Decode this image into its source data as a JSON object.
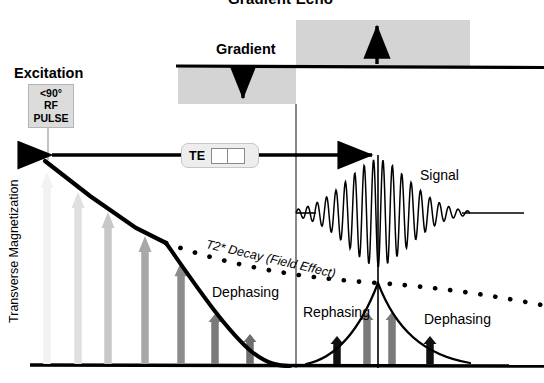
{
  "title": "Gradient Echo",
  "labels": {
    "excitation": "Excitation",
    "gradient": "Gradient",
    "signal": "Signal",
    "te": "TE",
    "t2_decay": "T2* Decay (Field Effect)",
    "y_axis": "Transverse Magnetization",
    "dephasing_1": "Dephasing",
    "rephasing": "Rephasing",
    "dephasing_2": "Dephasing"
  },
  "rf_pulse": {
    "flip_angle": "<90°",
    "line2": "RF",
    "line3": "PULSE"
  },
  "colors": {
    "ink": "#000000",
    "pulse_box_fill": "#dcdcdc",
    "gradient_lobe_fill": "#d4d4d4",
    "te_pill_fill": "#ededed",
    "grid_line": "#555555"
  },
  "chart_data": {
    "type": "line",
    "title": "Gradient Echo",
    "xlabel": "",
    "ylabel": "Transverse Magnetization",
    "grid": false,
    "legend": "none",
    "annotations": [
      "Excitation",
      "Gradient",
      "TE",
      "Signal",
      "T2* Decay (Field Effect)",
      "Dephasing",
      "Rephasing",
      "Dephasing"
    ],
    "series": [
      {
        "name": "T2 envelope (true decay)",
        "style": "solid-thick",
        "x": [
          45,
          90,
          135,
          180,
          225,
          252
        ],
        "y": [
          162,
          196,
          226,
          256,
          288,
          301
        ]
      },
      {
        "name": "T2* dephasing lobe",
        "style": "solid-thick",
        "x": [
          165,
          200,
          230,
          262,
          290
        ],
        "y": [
          243,
          278,
          317,
          349,
          360
        ]
      },
      {
        "name": "T2* rephasing lobe",
        "style": "solid-thin",
        "x": [
          306,
          330,
          352,
          370,
          378
        ],
        "y": [
          360,
          348,
          323,
          295,
          283
        ]
      },
      {
        "name": "T2* post-echo dephasing lobe",
        "style": "solid-thin",
        "x": [
          378,
          396,
          418,
          444,
          474
        ],
        "y": [
          283,
          300,
          325,
          345,
          358
        ]
      },
      {
        "name": "T2* decay (dotted field-effect envelope)",
        "style": "dotted",
        "x": [
          165,
          210,
          255,
          300,
          345,
          378,
          420,
          465,
          510,
          540
        ],
        "y": [
          243,
          256,
          268,
          275,
          280,
          283,
          290,
          296,
          301,
          304
        ]
      },
      {
        "name": "Gradient echo signal (RF readout)",
        "style": "oscillation",
        "peak_x": 378,
        "baseline_y": 213,
        "start_x": 296,
        "end_x": 470,
        "max_amplitude": 54
      }
    ],
    "gradient_waveform": {
      "baseline_y": 66,
      "negative_lobe": {
        "x0": 178,
        "x1": 296,
        "depth": 38,
        "arrow": "down"
      },
      "positive_lobe": {
        "x0": 296,
        "x1": 470,
        "height": 46,
        "arrow": "up"
      }
    },
    "te_interval": {
      "from_x": 45,
      "to_x": 378,
      "y": 155,
      "label": "TE"
    },
    "magnetization_vectors": [
      {
        "x": 47,
        "height": 192,
        "shade": "#f2f2f2"
      },
      {
        "x": 78,
        "height": 172,
        "shade": "#e0e0e0"
      },
      {
        "x": 108,
        "height": 152,
        "shade": "#c8c8c8"
      },
      {
        "x": 145,
        "height": 128,
        "shade": "#a8a8a8"
      },
      {
        "x": 181,
        "height": 102,
        "shade": "#8c8c8c"
      },
      {
        "x": 215,
        "height": 50,
        "shade": "#7a7a7a"
      },
      {
        "x": 250,
        "height": 30,
        "shade": "#6e6e6e"
      },
      {
        "x": 337,
        "height": 28,
        "shade": "#111111"
      },
      {
        "x": 367,
        "height": 52,
        "shade": "#7a7a7a"
      },
      {
        "x": 392,
        "height": 52,
        "shade": "#7a7a7a"
      },
      {
        "x": 430,
        "height": 28,
        "shade": "#111111"
      }
    ]
  }
}
